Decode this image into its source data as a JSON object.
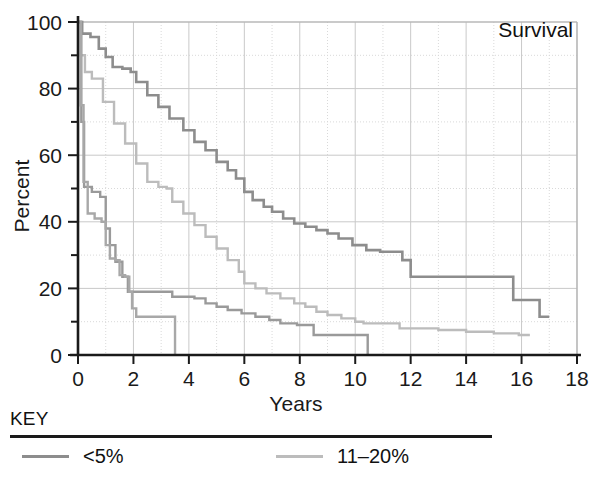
{
  "figure": {
    "annotation": "Survival",
    "x_axis_title": "Years",
    "y_axis_title": "Percent"
  },
  "legend": {
    "title": "KEY",
    "entries": [
      {
        "label": "<5%",
        "color": "#8d8d8d"
      },
      {
        "label": "11–20%",
        "color": "#bcbcbc"
      }
    ]
  },
  "chart_data": {
    "type": "line",
    "subtype": "kaplan-meier-step",
    "title": "Survival",
    "xlabel": "Years",
    "ylabel": "Percent",
    "xlim": [
      0,
      18
    ],
    "ylim": [
      0,
      100
    ],
    "xticks": [
      0,
      2,
      4,
      6,
      8,
      10,
      12,
      14,
      16,
      18
    ],
    "xtick_labels": [
      "0",
      "2",
      "4",
      "6",
      "8",
      "10",
      "12",
      "14",
      "16",
      "18"
    ],
    "yticks": [
      0,
      20,
      40,
      60,
      80,
      100
    ],
    "ytick_labels": [
      "0",
      "20",
      "40",
      "60",
      "80",
      "100"
    ],
    "minor_xticks": [
      1,
      3,
      5,
      7,
      9,
      11,
      13,
      15,
      17
    ],
    "minor_yticks": [
      10,
      30,
      50,
      70,
      90
    ],
    "grid": true,
    "grid_style": "major solid light-gray, minor dotted light-gray",
    "legend_position": "below-plot",
    "series": [
      {
        "name": "<5%",
        "color": "#8d8d8d",
        "linewidth": 2.6,
        "end_x": 17.0,
        "end_y": 11.5,
        "points": [
          [
            0.0,
            100.0
          ],
          [
            0.15,
            96.5
          ],
          [
            0.45,
            95.5
          ],
          [
            0.75,
            92.0
          ],
          [
            1.0,
            89.5
          ],
          [
            1.25,
            86.5
          ],
          [
            1.6,
            86.0
          ],
          [
            1.9,
            85.0
          ],
          [
            2.1,
            82.0
          ],
          [
            2.5,
            78.0
          ],
          [
            2.9,
            74.5
          ],
          [
            3.3,
            71.0
          ],
          [
            3.8,
            67.5
          ],
          [
            4.2,
            64.0
          ],
          [
            4.6,
            61.5
          ],
          [
            5.0,
            58.0
          ],
          [
            5.4,
            55.5
          ],
          [
            5.7,
            53.0
          ],
          [
            6.0,
            49.0
          ],
          [
            6.3,
            46.5
          ],
          [
            6.7,
            44.5
          ],
          [
            7.0,
            43.0
          ],
          [
            7.4,
            41.0
          ],
          [
            7.8,
            39.5
          ],
          [
            8.2,
            38.5
          ],
          [
            8.6,
            37.5
          ],
          [
            9.0,
            36.5
          ],
          [
            9.4,
            35.0
          ],
          [
            9.9,
            33.0
          ],
          [
            10.4,
            31.5
          ],
          [
            10.9,
            31.0
          ],
          [
            11.4,
            31.0
          ],
          [
            11.7,
            28.5
          ],
          [
            12.0,
            23.5
          ],
          [
            12.4,
            23.5
          ],
          [
            13.0,
            23.5
          ],
          [
            14.0,
            23.5
          ],
          [
            15.0,
            23.5
          ],
          [
            15.6,
            23.5
          ],
          [
            15.7,
            16.5
          ],
          [
            16.2,
            16.5
          ],
          [
            16.6,
            16.5
          ],
          [
            16.65,
            11.5
          ],
          [
            17.0,
            11.5
          ]
        ]
      },
      {
        "name": "11-20%",
        "color": "#bcbcbc",
        "linewidth": 2.4,
        "end_x": 16.3,
        "end_y": 6.0,
        "points": [
          [
            0.0,
            100.0
          ],
          [
            0.1,
            90.0
          ],
          [
            0.25,
            85.0
          ],
          [
            0.5,
            83.0
          ],
          [
            0.9,
            76.0
          ],
          [
            1.3,
            69.5
          ],
          [
            1.7,
            63.5
          ],
          [
            2.1,
            57.5
          ],
          [
            2.5,
            52.0
          ],
          [
            2.9,
            50.5
          ],
          [
            3.2,
            50.0
          ],
          [
            3.4,
            46.0
          ],
          [
            3.8,
            42.5
          ],
          [
            4.2,
            39.0
          ],
          [
            4.6,
            35.5
          ],
          [
            5.0,
            32.0
          ],
          [
            5.4,
            28.5
          ],
          [
            5.8,
            25.0
          ],
          [
            6.0,
            21.5
          ],
          [
            6.4,
            20.0
          ],
          [
            6.8,
            18.5
          ],
          [
            7.3,
            17.0
          ],
          [
            7.8,
            15.5
          ],
          [
            8.2,
            14.5
          ],
          [
            8.6,
            13.0
          ],
          [
            9.0,
            12.0
          ],
          [
            9.5,
            11.0
          ],
          [
            10.0,
            10.0
          ],
          [
            10.3,
            9.5
          ],
          [
            10.8,
            9.5
          ],
          [
            11.3,
            9.5
          ],
          [
            11.6,
            8.0
          ],
          [
            12.2,
            8.0
          ],
          [
            13.0,
            7.5
          ],
          [
            14.0,
            7.0
          ],
          [
            15.0,
            6.5
          ],
          [
            15.9,
            6.0
          ],
          [
            16.3,
            6.0
          ]
        ]
      },
      {
        "name": "curve-3",
        "color": "#9a9a9a",
        "linewidth": 2.4,
        "end_x": 10.45,
        "end_y": 0.0,
        "points": [
          [
            0.0,
            100.0
          ],
          [
            0.12,
            70.0
          ],
          [
            0.22,
            50.5
          ],
          [
            0.5,
            49.0
          ],
          [
            0.8,
            47.5
          ],
          [
            1.0,
            44.0
          ],
          [
            1.0,
            38.0
          ],
          [
            1.15,
            33.0
          ],
          [
            1.3,
            33.0
          ],
          [
            1.35,
            28.0
          ],
          [
            1.55,
            28.0
          ],
          [
            1.6,
            23.5
          ],
          [
            1.75,
            23.5
          ],
          [
            1.8,
            19.0
          ],
          [
            2.3,
            19.0
          ],
          [
            3.0,
            19.0
          ],
          [
            3.3,
            19.0
          ],
          [
            3.4,
            17.5
          ],
          [
            3.9,
            17.5
          ],
          [
            4.2,
            17.0
          ],
          [
            4.6,
            15.5
          ],
          [
            5.0,
            14.5
          ],
          [
            5.4,
            13.5
          ],
          [
            5.9,
            12.5
          ],
          [
            6.4,
            11.5
          ],
          [
            6.9,
            10.5
          ],
          [
            7.3,
            9.5
          ],
          [
            7.9,
            9.0
          ],
          [
            8.3,
            9.0
          ],
          [
            8.5,
            6.0
          ],
          [
            9.0,
            6.0
          ],
          [
            9.8,
            6.0
          ],
          [
            10.3,
            6.0
          ],
          [
            10.45,
            6.0
          ],
          [
            10.45,
            0.0
          ]
        ]
      },
      {
        "name": "curve-4",
        "color": "#a8a8a8",
        "linewidth": 2.4,
        "end_x": 3.5,
        "end_y": 0.0,
        "points": [
          [
            0.0,
            100.0
          ],
          [
            0.1,
            75.0
          ],
          [
            0.2,
            52.0
          ],
          [
            0.35,
            42.5
          ],
          [
            0.6,
            41.0
          ],
          [
            0.85,
            40.0
          ],
          [
            1.0,
            33.0
          ],
          [
            1.15,
            29.0
          ],
          [
            1.35,
            28.5
          ],
          [
            1.5,
            24.0
          ],
          [
            1.7,
            23.5
          ],
          [
            1.85,
            19.0
          ],
          [
            1.95,
            14.0
          ],
          [
            2.1,
            11.5
          ],
          [
            2.4,
            11.5
          ],
          [
            2.9,
            11.5
          ],
          [
            3.4,
            11.5
          ],
          [
            3.5,
            11.5
          ],
          [
            3.5,
            0.0
          ]
        ]
      }
    ]
  }
}
